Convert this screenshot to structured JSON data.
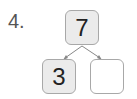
{
  "problem_number": "4.",
  "number_bond": {
    "whole": "7",
    "parts": [
      "3",
      ""
    ]
  }
}
